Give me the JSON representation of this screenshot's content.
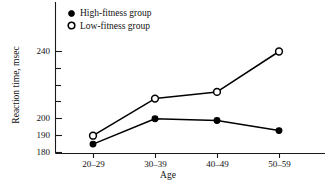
{
  "chart_data": {
    "type": "line",
    "title": "",
    "xlabel": "Age",
    "ylabel": "Reaction time, msec",
    "categories": [
      "20–29",
      "30–39",
      "40–49",
      "50–59"
    ],
    "ylim": [
      180,
      250
    ],
    "yticks_labeled": [
      "180",
      "190",
      "200",
      "240"
    ],
    "yticks_labeled_values": [
      180,
      190,
      200,
      240
    ],
    "yticks_minor_values": [
      210,
      220,
      230
    ],
    "grid": false,
    "legend_position": "top-left-inside",
    "series": [
      {
        "name": "High-fitness group",
        "marker": "filled-circle",
        "values": [
          185,
          200,
          199,
          193
        ]
      },
      {
        "name": "Low-fitness group",
        "marker": "open-circle",
        "values": [
          190,
          212,
          216,
          240
        ]
      }
    ]
  },
  "axes": {
    "y_title": "Reaction time, msec",
    "x_title": "Age",
    "y_tick_labels": [
      "240",
      "200",
      "190",
      "180"
    ],
    "x_tick_labels": [
      "20–29",
      "30–39",
      "40–49",
      "50–59"
    ]
  },
  "legend": {
    "items": [
      {
        "label": "High-fitness group",
        "marker": "filled-circle"
      },
      {
        "label": "Low-fitness group",
        "marker": "open-circle"
      }
    ]
  },
  "colors": {
    "ink": "#000000",
    "background": "#ffffff"
  }
}
